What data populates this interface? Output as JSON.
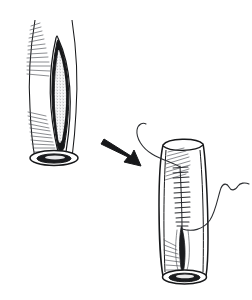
{
  "figure": {
    "title": "Longitudinal incision repaired with running suture",
    "background_color": "#ffffff",
    "ink_color": "#17181a",
    "hatch_color": "#4c4f55",
    "stipple_color": "#8d8f93",
    "width": 252,
    "height": 300,
    "panels": [
      {
        "name": "before",
        "label": "Incised tube with open longitudinal wound",
        "position": "left",
        "center_x": 88,
        "center_y": 88,
        "elements": [
          "tube-body",
          "incision-opening",
          "incision-interior-stipple",
          "shading-hatch-upper-left",
          "shading-hatch-lower-left",
          "distal-lumen-ellipse"
        ]
      },
      {
        "name": "after",
        "label": "Tube closed with running suture line",
        "position": "right",
        "center_x": 185,
        "center_y": 210,
        "elements": [
          "tube-body",
          "suture-line",
          "suture-rungs",
          "suture-thread-tail-upper",
          "suture-thread-tail-lower",
          "closed-scar",
          "shading-hatch-upper",
          "shading-hatch-lower",
          "distal-lumen-ellipse"
        ]
      }
    ],
    "arrow": {
      "name": "progression-arrow",
      "direction": "down-right",
      "from_x": 103,
      "from_y": 140,
      "to_x": 140,
      "to_y": 165,
      "color": "#17181a"
    },
    "suture": {
      "stitch_count": 13,
      "pattern": "running ladder stitch",
      "top_y": 168,
      "bottom_y": 228,
      "thread_color": "#2a2c30"
    }
  }
}
